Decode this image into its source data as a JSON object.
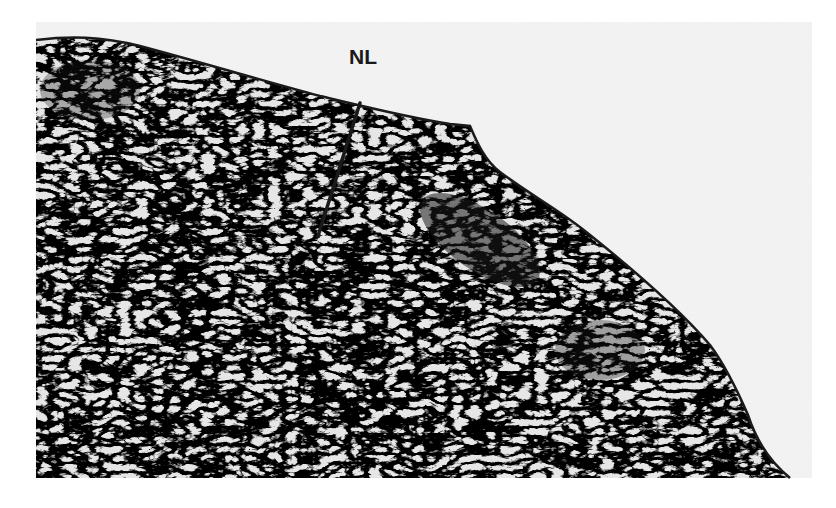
{
  "figure": {
    "type": "histology-micrograph",
    "mode": "grayscale",
    "background_color": "#f4f4f4",
    "page_color": "#ffffff",
    "tissue_dark": "#1c1c1c",
    "tissue_light": "#e9e9e9",
    "annotations": [
      {
        "label": "NL",
        "x": 349,
        "y": 45,
        "line_from": [
          360,
          103
        ],
        "line_to": [
          318,
          236
        ]
      }
    ]
  }
}
